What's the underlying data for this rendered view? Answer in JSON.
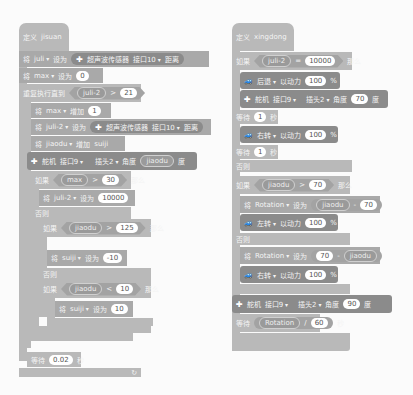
{
  "left_script": {
    "define_label": "定义",
    "proc_name": "jisuan",
    "b1": {
      "set": "将",
      "var": "juli",
      "to": "设为",
      "sensor": "超声波传感器",
      "port": "接口10",
      "dist": "距离"
    },
    "b2": {
      "set": "将",
      "var": "max",
      "to": "设为",
      "value": "0"
    },
    "b3": {
      "label": "重复执行直到",
      "var": "juli-2",
      "op": ">",
      "value": "21"
    },
    "b4": {
      "set": "将",
      "var": "max",
      "op": "增加",
      "value": "1"
    },
    "b5": {
      "set": "将",
      "var": "juli-2",
      "to": "设为",
      "sensor": "超声波传感器",
      "port": "接口10",
      "dist": "距离"
    },
    "b6": {
      "set": "将",
      "var": "jiaodu",
      "op": "增加",
      "value": "suiji"
    },
    "b7": {
      "label": "舵机",
      "port": "接口9",
      "slot": "插头2",
      "angle": "角度",
      "value": "jiaodu",
      "unit": "度"
    },
    "b8": {
      "if": "如果",
      "var": "max",
      "op": ">",
      "value": "30",
      "then": "那么"
    },
    "b9": {
      "set": "将",
      "var": "juli-2",
      "to": "设为",
      "value": "10000"
    },
    "b10": {
      "else": "否则"
    },
    "b11": {
      "if": "如果",
      "var": "jiaodu",
      "op": ">",
      "value": "125",
      "then": "那么"
    },
    "b12": {
      "set": "将",
      "var": "suiji",
      "to": "设为",
      "value": "-10"
    },
    "b13": {
      "else": "否则"
    },
    "b14": {
      "if": "如果",
      "var": "jiaodu",
      "op": "<",
      "value": "10",
      "then": "那么"
    },
    "b15": {
      "set": "将",
      "var": "suiji",
      "to": "设为",
      "value": "10"
    },
    "b16": {
      "wait": "等待",
      "value": "0.02",
      "unit": "秒"
    },
    "loop_icon": "↻"
  },
  "right_script": {
    "define_label": "定义",
    "proc_name": "xingdong",
    "b1": {
      "if": "如果",
      "var": "juli-2",
      "op": "=",
      "value": "10000",
      "then": "那么"
    },
    "b2": {
      "dir": "后退",
      "power": "以动力",
      "value": "100",
      "unit": "%"
    },
    "b3": {
      "label": "舵机",
      "port": "接口9",
      "slot": "插头2",
      "angle": "角度",
      "value": "70",
      "unit": "度"
    },
    "b4": {
      "wait": "等待",
      "value": "1",
      "unit": "秒"
    },
    "b5": {
      "dir": "右转",
      "power": "以动力",
      "value": "100",
      "unit": "%"
    },
    "b6": {
      "wait": "等待",
      "value": "1",
      "unit": "秒"
    },
    "b7": {
      "else": "否则"
    },
    "b8": {
      "if": "如果",
      "var": "jiaodu",
      "op": ">",
      "value": "70",
      "then": "那么"
    },
    "b9": {
      "set": "将",
      "var": "Rotation",
      "to": "设为",
      "a": "jiaodu",
      "op": "-",
      "b": "70"
    },
    "b10": {
      "dir": "左转",
      "power": "以动力",
      "value": "100",
      "unit": "%"
    },
    "b11": {
      "else": "否则"
    },
    "b12": {
      "set": "将",
      "var": "Rotation",
      "to": "设为",
      "a": "70",
      "op": "-",
      "b": "jiaodu"
    },
    "b13": {
      "dir": "右转",
      "power": "以动力",
      "value": "100",
      "unit": "%"
    },
    "b14": {
      "label": "舵机",
      "port": "接口9",
      "slot": "插头2",
      "angle": "角度",
      "value": "90",
      "unit": "度"
    },
    "b15": {
      "wait": "等待",
      "a": "Rotation",
      "op": "/",
      "b": "60",
      "unit": "秒"
    }
  }
}
